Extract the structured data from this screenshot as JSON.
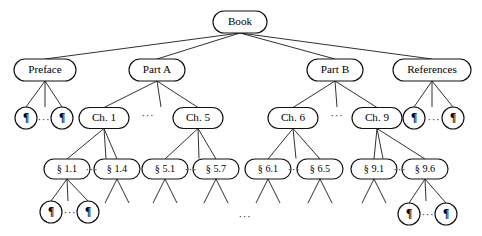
{
  "diagram": {
    "type": "tree",
    "background_color": "#ffffff",
    "node_stroke_color": "#111111",
    "node_fill_color": "#ffffff",
    "edge_color": "#1a1a1a",
    "text_color": "#000000",
    "ellipsis_glyph": "···",
    "pilcrow_glyph": "¶",
    "section_sign": "§",
    "nodes": [
      {
        "id": "book",
        "label": "Book",
        "shape": "rounded-rect",
        "x": 240,
        "y": 22,
        "w": 54,
        "h": 22,
        "level": 0
      },
      {
        "id": "preface",
        "label": "Preface",
        "shape": "rounded-rect",
        "x": 45,
        "y": 70,
        "w": 62,
        "h": 22,
        "level": 1
      },
      {
        "id": "partA",
        "label": "Part A",
        "shape": "rounded-rect",
        "x": 157,
        "y": 70,
        "w": 56,
        "h": 22,
        "level": 1
      },
      {
        "id": "partB",
        "label": "Part B",
        "shape": "rounded-rect",
        "x": 335,
        "y": 70,
        "w": 56,
        "h": 22,
        "level": 1
      },
      {
        "id": "refs",
        "label": "References",
        "shape": "rounded-rect",
        "x": 432,
        "y": 70,
        "w": 78,
        "h": 22,
        "level": 1
      },
      {
        "id": "pre-p1",
        "label": "¶",
        "shape": "circle",
        "x": 26,
        "y": 118,
        "r": 11,
        "level": 2
      },
      {
        "id": "pre-p2",
        "label": "¶",
        "shape": "circle",
        "x": 62,
        "y": 118,
        "r": 11,
        "level": 2
      },
      {
        "id": "ch1",
        "label": "Ch. 1",
        "shape": "rounded-rect",
        "x": 104,
        "y": 118,
        "w": 50,
        "h": 21,
        "level": 2
      },
      {
        "id": "ch5",
        "label": "Ch. 5",
        "shape": "rounded-rect",
        "x": 198,
        "y": 118,
        "w": 50,
        "h": 21,
        "level": 2
      },
      {
        "id": "ch6",
        "label": "Ch. 6",
        "shape": "rounded-rect",
        "x": 293,
        "y": 118,
        "w": 50,
        "h": 21,
        "level": 2
      },
      {
        "id": "ch9",
        "label": "Ch. 9",
        "shape": "rounded-rect",
        "x": 377,
        "y": 118,
        "w": 50,
        "h": 21,
        "level": 2
      },
      {
        "id": "ref-p1",
        "label": "¶",
        "shape": "circle",
        "x": 414,
        "y": 118,
        "r": 11,
        "level": 2
      },
      {
        "id": "ref-p2",
        "label": "¶",
        "shape": "circle",
        "x": 453,
        "y": 118,
        "r": 11,
        "level": 2
      },
      {
        "id": "s1-1",
        "label": "§ 1.1",
        "shape": "rounded-rect",
        "x": 67,
        "y": 169,
        "w": 46,
        "h": 20,
        "level": 3
      },
      {
        "id": "s1-4",
        "label": "§ 1.4",
        "shape": "rounded-rect",
        "x": 117,
        "y": 169,
        "w": 46,
        "h": 20,
        "level": 3
      },
      {
        "id": "s5-1",
        "label": "§ 5.1",
        "shape": "rounded-rect",
        "x": 165,
        "y": 169,
        "w": 46,
        "h": 20,
        "level": 3
      },
      {
        "id": "s5-7",
        "label": "§ 5.7",
        "shape": "rounded-rect",
        "x": 216,
        "y": 169,
        "w": 46,
        "h": 20,
        "level": 3
      },
      {
        "id": "s6-1",
        "label": "§ 6.1",
        "shape": "rounded-rect",
        "x": 268,
        "y": 169,
        "w": 46,
        "h": 20,
        "level": 3
      },
      {
        "id": "s6-5",
        "label": "§ 6.5",
        "shape": "rounded-rect",
        "x": 320,
        "y": 169,
        "w": 46,
        "h": 20,
        "level": 3
      },
      {
        "id": "s9-1",
        "label": "§ 9.1",
        "shape": "rounded-rect",
        "x": 374,
        "y": 169,
        "w": 46,
        "h": 20,
        "level": 3
      },
      {
        "id": "s9-6",
        "label": "§ 9.6",
        "shape": "rounded-rect",
        "x": 425,
        "y": 169,
        "w": 46,
        "h": 20,
        "level": 3
      },
      {
        "id": "s11-p1",
        "label": "¶",
        "shape": "circle",
        "x": 51,
        "y": 212,
        "r": 11,
        "level": 4
      },
      {
        "id": "s11-p2",
        "label": "¶",
        "shape": "circle",
        "x": 88,
        "y": 212,
        "r": 11,
        "level": 4
      },
      {
        "id": "s96-p1",
        "label": "¶",
        "shape": "circle",
        "x": 409,
        "y": 214,
        "r": 11,
        "level": 4
      },
      {
        "id": "s96-p2",
        "label": "¶",
        "shape": "circle",
        "x": 446,
        "y": 214,
        "r": 11,
        "level": 4
      }
    ],
    "edges": [
      {
        "from": "book",
        "to": "preface"
      },
      {
        "from": "book",
        "to": "partA"
      },
      {
        "from": "book",
        "to": "partB"
      },
      {
        "from": "book",
        "to": "refs"
      },
      {
        "from": "preface",
        "to": "pre-p1"
      },
      {
        "from": "preface",
        "to": "pre-p2"
      },
      {
        "from": "partA",
        "to": "ch1"
      },
      {
        "from": "partA",
        "to": "ch5"
      },
      {
        "from": "partB",
        "to": "ch6"
      },
      {
        "from": "partB",
        "to": "ch9"
      },
      {
        "from": "refs",
        "to": "ref-p1"
      },
      {
        "from": "refs",
        "to": "ref-p2"
      },
      {
        "from": "ch1",
        "to": "s1-1"
      },
      {
        "from": "ch1",
        "to": "s1-4"
      },
      {
        "from": "ch5",
        "to": "s5-1"
      },
      {
        "from": "ch5",
        "to": "s5-7"
      },
      {
        "from": "ch6",
        "to": "s6-1"
      },
      {
        "from": "ch6",
        "to": "s6-5"
      },
      {
        "from": "ch9",
        "to": "s9-1"
      },
      {
        "from": "ch9",
        "to": "s9-6"
      },
      {
        "from": "s1-1",
        "to": "s11-p1"
      },
      {
        "from": "s1-1",
        "to": "s11-p2"
      },
      {
        "from": "s9-6",
        "to": "s96-p1"
      },
      {
        "from": "s9-6",
        "to": "s96-p2"
      }
    ],
    "stub_edges": [
      {
        "parent": "preface",
        "dx": 0,
        "len": 26
      },
      {
        "parent": "partA",
        "dx": 4,
        "len": 26
      },
      {
        "parent": "partB",
        "dx": 2,
        "len": 26
      },
      {
        "parent": "refs",
        "dx": 0,
        "len": 26
      },
      {
        "parent": "ch1",
        "dx": 2,
        "len": 30
      },
      {
        "parent": "ch5",
        "dx": 1,
        "len": 30
      },
      {
        "parent": "ch6",
        "dx": 3,
        "len": 30
      },
      {
        "parent": "ch9",
        "dx": 6,
        "len": 30
      },
      {
        "parent": "s1-1",
        "dx": 1,
        "len": 22
      },
      {
        "parent": "s1-4",
        "dx": -12,
        "len": 24
      },
      {
        "parent": "s1-4",
        "dx": 12,
        "len": 24
      },
      {
        "parent": "s5-1",
        "dx": -12,
        "len": 24
      },
      {
        "parent": "s5-1",
        "dx": 12,
        "len": 24
      },
      {
        "parent": "s5-7",
        "dx": -12,
        "len": 24
      },
      {
        "parent": "s5-7",
        "dx": 12,
        "len": 24
      },
      {
        "parent": "s6-1",
        "dx": -12,
        "len": 24
      },
      {
        "parent": "s6-1",
        "dx": 12,
        "len": 24
      },
      {
        "parent": "s6-5",
        "dx": -12,
        "len": 24
      },
      {
        "parent": "s6-5",
        "dx": 12,
        "len": 24
      },
      {
        "parent": "s9-1",
        "dx": -12,
        "len": 24
      },
      {
        "parent": "s9-1",
        "dx": 12,
        "len": 24
      },
      {
        "parent": "s9-6",
        "dx": 1,
        "len": 22
      }
    ],
    "ellipses": [
      {
        "id": "ell-preface-children",
        "text": "···",
        "x": 44,
        "y": 120
      },
      {
        "id": "ell-partA-chapters",
        "text": "···",
        "x": 148,
        "y": 116
      },
      {
        "id": "ell-partB-chapters",
        "text": "···",
        "x": 337,
        "y": 116
      },
      {
        "id": "ell-refs-children",
        "text": "···",
        "x": 434,
        "y": 120
      },
      {
        "id": "ell-ch1-sections",
        "text": "···",
        "x": 92,
        "y": 170
      },
      {
        "id": "ell-ch5-sections",
        "text": "···",
        "x": 191,
        "y": 170
      },
      {
        "id": "ell-ch6-sections",
        "text": "···",
        "x": 294,
        "y": 170
      },
      {
        "id": "ell-ch9-sections",
        "text": "···",
        "x": 400,
        "y": 170
      },
      {
        "id": "ell-s11-paras",
        "text": "···",
        "x": 70,
        "y": 213
      },
      {
        "id": "ell-s96-paras",
        "text": "···",
        "x": 428,
        "y": 215
      },
      {
        "id": "ell-bottom-center",
        "text": "···",
        "x": 245,
        "y": 217
      }
    ]
  }
}
